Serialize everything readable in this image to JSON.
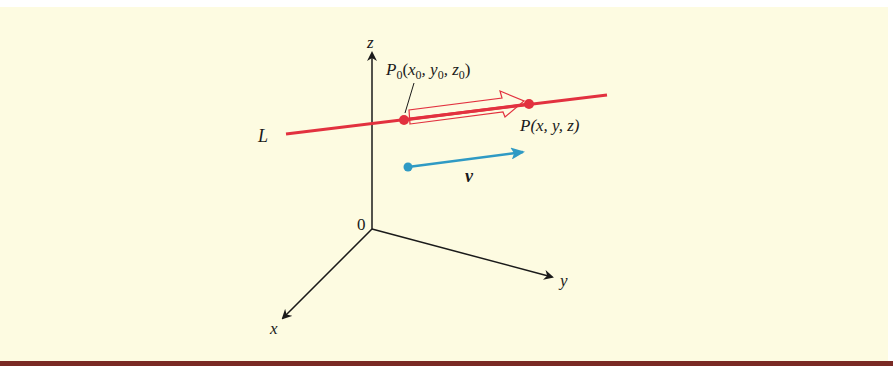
{
  "figure": {
    "background_color": "#fdfbe1",
    "border_bar_color": "#7a2a24",
    "axes": {
      "origin_label": "0",
      "x_label": "x",
      "y_label": "y",
      "z_label": "z",
      "color": "#1a1a1a"
    },
    "line": {
      "label": "L",
      "color": "#e2313f"
    },
    "points": {
      "p0": {
        "name": "P",
        "subscript": "0",
        "coords_text": [
          "x",
          "0",
          ", y",
          "0",
          ", z",
          "0"
        ]
      },
      "p": {
        "label": "P(x, y, z)"
      }
    },
    "displacement_arrow": {
      "style": "hollow",
      "color": "#e2313f"
    },
    "direction_vector": {
      "label": "v",
      "color": "#2f9ac4"
    }
  }
}
